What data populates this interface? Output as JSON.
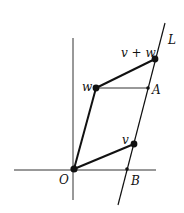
{
  "diagram": {
    "labels": {
      "line": "L",
      "sum": "v + w",
      "w": "w",
      "v": "v",
      "origin": "O",
      "a": "A",
      "b": "B"
    },
    "colors": {
      "ink": "#111111",
      "axis": "#333333"
    }
  }
}
